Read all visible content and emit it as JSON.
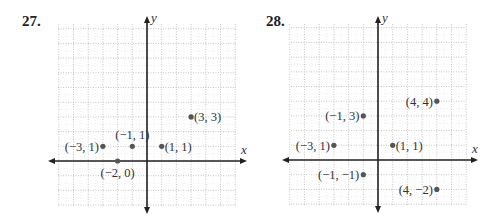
{
  "chart_data": [
    {
      "type": "scatter",
      "title": "27.",
      "xlabel": "x",
      "ylabel": "y",
      "grid": true,
      "xlim": [
        -6,
        6
      ],
      "ylim": [
        -3,
        9
      ],
      "points": [
        {
          "x": -3,
          "y": 1,
          "label": "(−3, 1)",
          "label_pos": "left"
        },
        {
          "x": -1,
          "y": 1,
          "label": "(−1, 1)",
          "label_pos": "above"
        },
        {
          "x": 1,
          "y": 1,
          "label": "(1, 1)",
          "label_pos": "right"
        },
        {
          "x": 3,
          "y": 3,
          "label": "(3, 3)",
          "label_pos": "right"
        },
        {
          "x": -2,
          "y": 0,
          "label": "(−2, 0)",
          "label_pos": "below"
        }
      ]
    },
    {
      "type": "scatter",
      "title": "28.",
      "xlabel": "x",
      "ylabel": "y",
      "grid": true,
      "xlim": [
        -6,
        6
      ],
      "ylim": [
        -3,
        9
      ],
      "points": [
        {
          "x": 4,
          "y": 4,
          "label": "(4, 4)",
          "label_pos": "left"
        },
        {
          "x": -1,
          "y": 3,
          "label": "(−1, 3)",
          "label_pos": "left"
        },
        {
          "x": -3,
          "y": 1,
          "label": "(−3, 1)",
          "label_pos": "left"
        },
        {
          "x": 1,
          "y": 1,
          "label": "(1, 1)",
          "label_pos": "right"
        },
        {
          "x": -1,
          "y": -1,
          "label": "(−1, −1)",
          "label_pos": "left"
        },
        {
          "x": 4,
          "y": -2,
          "label": "(4, −2)",
          "label_pos": "left"
        }
      ]
    }
  ],
  "layout": [
    {
      "panel_left": 0,
      "num_left": 22,
      "origin_x": 147,
      "origin_y": 161,
      "step": 14.7,
      "grid_left": 58,
      "grid_right": 236,
      "grid_top": 24,
      "grid_bottom": 207,
      "axis_x_min": 48,
      "axis_x_max": 247,
      "axis_y_min": 16,
      "axis_y_max": 214
    },
    {
      "panel_left": 251,
      "num_left": 15,
      "origin_x": 127,
      "origin_y": 160,
      "step": 14.7,
      "grid_left": 40,
      "grid_right": 215,
      "grid_top": 24,
      "grid_bottom": 205,
      "axis_x_min": 31,
      "axis_x_max": 227,
      "axis_y_min": 16,
      "axis_y_max": 213
    }
  ],
  "colors": {
    "point": "#555555",
    "axis": "#222222",
    "grid": "#b8b8b8",
    "grid_minor": "#dedede"
  }
}
